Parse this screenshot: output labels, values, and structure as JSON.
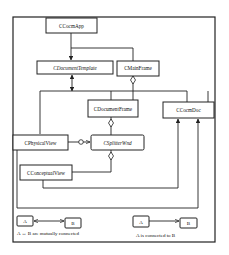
{
  "nodes": {
    "app": {
      "label": "CCocmApp"
    },
    "doc_template": {
      "label": "CDocumentTemplate"
    },
    "main_frame": {
      "label": "CMainFrame"
    },
    "document_frame": {
      "label": "CDocumentFrame"
    },
    "doc": {
      "label": "CCocmDoc"
    },
    "physical_view": {
      "label": "CPhysicalView"
    },
    "splitter_wnd": {
      "label": "CSplitterWnd"
    },
    "conceptual_view": {
      "label": "CConceptualView"
    }
  },
  "legend": {
    "mutual": {
      "a": "A",
      "b": "B",
      "caption": "A ↔ B are mutually connected"
    },
    "directed": {
      "a": "A",
      "b": "B",
      "caption": "A is connected to B"
    }
  },
  "colors": {
    "stroke": "#222222",
    "background": "#ffffff"
  }
}
